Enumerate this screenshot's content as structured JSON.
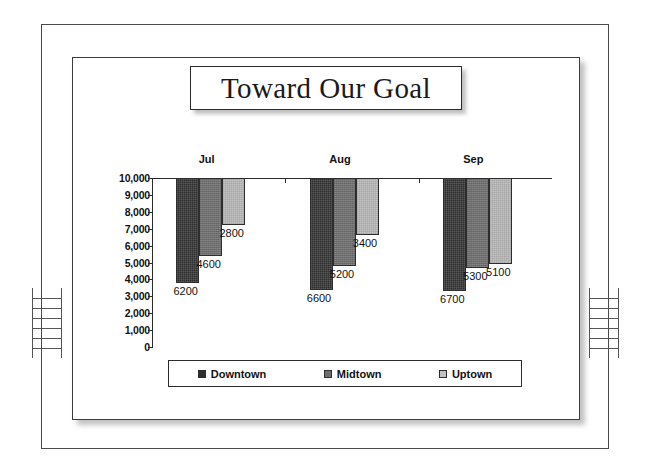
{
  "frame": {
    "ladder_left_name": "binder-ladder-left",
    "ladder_right_name": "binder-ladder-right",
    "ladder_rungs": 6
  },
  "chart_data": {
    "type": "bar",
    "title": "Toward Our Goal",
    "orientation": "inverted-hanging-bars",
    "categories": [
      "Jul",
      "Aug",
      "Sep"
    ],
    "series": [
      {
        "name": "Downtown",
        "color": "#2e2e2e",
        "values": [
          6200,
          6600,
          6700
        ]
      },
      {
        "name": "Midtown",
        "color": "#6f6f6f",
        "values": [
          4600,
          5200,
          5300
        ]
      },
      {
        "name": "Uptown",
        "color": "#c2c2c2",
        "values": [
          2800,
          3400,
          5100
        ]
      }
    ],
    "xlabel": "",
    "ylabel": "",
    "ylim": [
      0,
      10000
    ],
    "ytick_step": 1000,
    "ytick_labels": [
      "10,000",
      "9,000",
      "8,000",
      "7,000",
      "6,000",
      "5,000",
      "4,000",
      "3,000",
      "2,000",
      "1,000",
      "0"
    ],
    "ytick_values": [
      10000,
      9000,
      8000,
      7000,
      6000,
      5000,
      4000,
      3000,
      2000,
      1000,
      0
    ],
    "grid": false,
    "legend_position": "bottom",
    "data_labels_shown": true
  }
}
